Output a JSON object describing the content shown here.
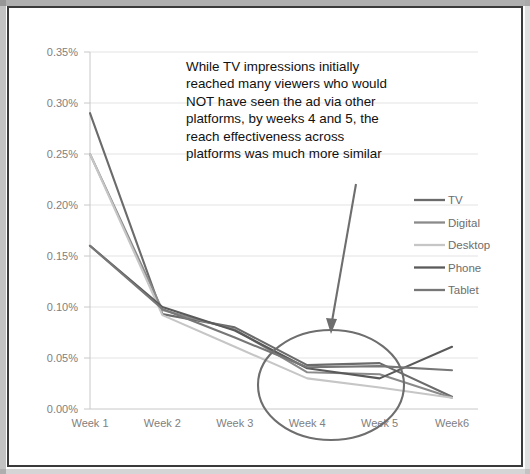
{
  "chart_data": {
    "type": "line",
    "title": "",
    "xlabel": "",
    "ylabel": "",
    "categories": [
      "Week 1",
      "Week 2",
      "Week 3",
      "Week 4",
      "Week 5",
      "Week6"
    ],
    "ytick_labels": [
      "0.00%",
      "0.05%",
      "0.10%",
      "0.15%",
      "0.20%",
      "0.25%",
      "0.30%",
      "0.35%"
    ],
    "ytick_values": [
      0.0,
      0.05,
      0.1,
      0.15,
      0.2,
      0.25,
      0.3,
      0.35
    ],
    "ylim": [
      0.0,
      0.35
    ],
    "grid": "horizontal",
    "legend_position": "right",
    "series": [
      {
        "name": "TV",
        "values": [
          0.29,
          0.093,
          0.08,
          0.043,
          0.045,
          0.012
        ],
        "color": "#6b6b6b"
      },
      {
        "name": "Digital",
        "values": [
          0.25,
          0.097,
          0.078,
          0.036,
          0.034,
          0.011
        ],
        "color": "#8a8a8a"
      },
      {
        "name": "Desktop",
        "values": [
          0.25,
          0.092,
          0.061,
          0.03,
          0.021,
          0.011
        ],
        "color": "#c6c6c6"
      },
      {
        "name": "Phone",
        "values": [
          0.16,
          0.1,
          0.077,
          0.04,
          0.03,
          0.061
        ],
        "color": "#5a5a5a"
      },
      {
        "name": "Tablet",
        "values": [
          0.16,
          0.098,
          0.07,
          0.041,
          0.042,
          0.038
        ],
        "color": "#777777"
      }
    ]
  },
  "annotation": {
    "lines": [
      "While TV impressions initially",
      "reached many viewers who would",
      "NOT have seen the ad via other",
      "platforms, by weeks 4 and 5, the",
      "reach effectiveness across",
      "platforms was much more similar"
    ]
  },
  "legend": {
    "items": [
      {
        "label": "TV"
      },
      {
        "label": "Digital"
      },
      {
        "label": "Desktop"
      },
      {
        "label": "Phone"
      },
      {
        "label": "Tablet"
      }
    ]
  },
  "colors": {
    "border": "#3a3a3a",
    "grid": "#e3e3e3",
    "axis": "#c8c8c8",
    "tick_text": "#808080",
    "annotation_text": "#111111",
    "callout": "#6e6e6e"
  }
}
